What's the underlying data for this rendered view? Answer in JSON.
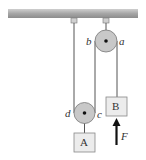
{
  "diagram": {
    "type": "pulley-system",
    "ceiling": {
      "color": "#a9a9a9"
    },
    "pulleys": [
      {
        "id": "upper",
        "fixed": true,
        "left_label": "b",
        "right_label": "a"
      },
      {
        "id": "lower",
        "fixed": false,
        "left_label": "d",
        "right_label": "c"
      }
    ],
    "blocks": [
      {
        "id": "A",
        "label": "A"
      },
      {
        "id": "B",
        "label": "B"
      }
    ],
    "force": {
      "label": "F",
      "direction": "up",
      "applied_to": "B"
    },
    "colors": {
      "pulley_fill": "#c8c8c8",
      "block_fill": "#ececec",
      "rope": "#555555",
      "arrow": "#111111"
    }
  }
}
